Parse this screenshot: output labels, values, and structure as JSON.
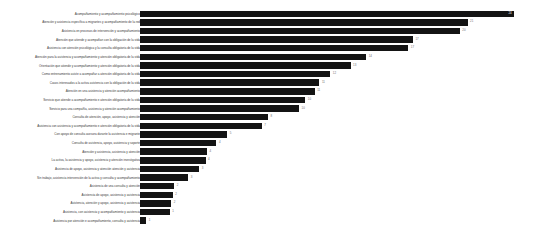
{
  "chart_data": {
    "type": "bar",
    "orientation": "horizontal",
    "title": "",
    "subtitle": "",
    "xlabel": "",
    "ylabel": "",
    "grid": false,
    "legend": null,
    "xlim": [
      0,
      25
    ],
    "bar_color": "#141414",
    "background_color": "#ffffff",
    "label_color": "#3b3b3b",
    "value_color": "#6f6f6f",
    "categories": [
      "Acompañamiento y acompañamiento psicológico",
      "Atención y asistencia específica a migrantes y acompañamiento de la red",
      "Asistencia en procesos de intervención y acompañamiento",
      "Atención que atiende y acompañan con la obligación de la vida",
      "Asistencia con atención psicológica y la consulta obligatoria de la vida",
      "Atención para la asistencia y acompañamiento y atención obligatoria de la vida",
      "Orientación que atiende y acompañamiento y atención obligatoria de la vida",
      "Como entrenamiento asiste a acompañar a atención obligatoria de la vida",
      "Casos interesados a la activa asistencia con la obligación de la vida",
      "Atención en una asistencia y atención acompañamiento",
      "Servicio que atiende a acompañamiento e atención obligatoria de la vida",
      "Servicio para una compañía, asistencia y atención acompañamiento",
      "Consulta de atención, apoyo, asistencia y atención",
      "Asistencia con asistencia y acompañamiento e atención obligatoria de la vida",
      "Con apoyo de consulta asesora durante la asistencia e migrante",
      "Consulta de asistencia, apoyo, asistencia y soporte",
      "Atención y asistencia, asistencia y atención",
      "La activa, la asistencia y apoyo, asistencia y atención investigativa",
      "Asistencia de apoyo, asistencia y atención atención y asistencia",
      "Sin trabajo, asistencia intervención de la activa y consulta y acompañamiento",
      "Asistencia de una consulta y atención",
      "Asistencia de apoyo, asistencia y asistencia",
      "Asistencia, atención y apoyo, asistencia y asistencia",
      "Asistencia, con asistencia y acompañamiento y asistencia",
      "Asistencia por atención e acompañamiento, consulta y asistencia"
    ],
    "values": [
      24,
      21,
      20.5,
      17.5,
      17.2,
      14.5,
      13.5,
      12.2,
      11.5,
      11.2,
      10.6,
      10.2,
      8.2,
      7.8,
      5.6,
      4.9,
      4.3,
      4.2,
      3.8,
      3.1,
      2.2,
      2.1,
      2.0,
      1.9,
      0.4
    ],
    "value_labels": [
      "24",
      "21",
      "20",
      "17",
      "17",
      "14",
      "13",
      "12",
      "11",
      "11",
      "10",
      "10",
      "8",
      "7",
      "5",
      "4",
      "4",
      "4",
      "3",
      "3",
      "2",
      "2",
      "2",
      "1",
      "1"
    ]
  }
}
